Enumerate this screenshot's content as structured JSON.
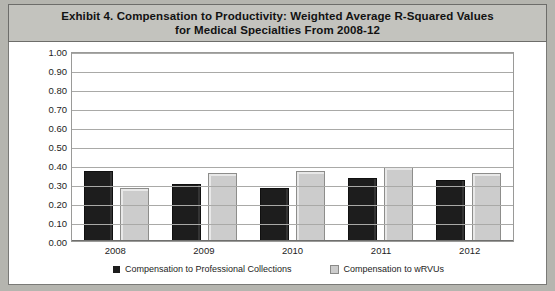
{
  "title": {
    "line1": "Exhibit 4. Compensation to Productivity: Weighted Average R-Squared Values",
    "line2": "for Medical Specialties From 2008-12"
  },
  "colors": {
    "series_dark": "#1d1d1d",
    "series_light": "#cccccc",
    "gridline": "#a9a9a7",
    "title_band": "#c3c3be",
    "page_background": "#b5b5af",
    "plot_background": "#ffffff"
  },
  "chart_data": {
    "type": "bar",
    "title": "Exhibit 4. Compensation to Productivity: Weighted Average R-Squared Values for Medical Specialties From 2008-12",
    "xlabel": "",
    "ylabel": "",
    "ylim": [
      0,
      1
    ],
    "ytick_step": 0.1,
    "ytick_labels": [
      "1.00",
      "0.90",
      "0.80",
      "0.70",
      "0.60",
      "0.50",
      "0.40",
      "0.30",
      "0.20",
      "0.10",
      "0.00"
    ],
    "grid": true,
    "legend_position": "bottom",
    "categories": [
      "2008",
      "2009",
      "2010",
      "2011",
      "2012"
    ],
    "series": [
      {
        "name": "Compensation to Professional Collections",
        "color": "#1d1d1d",
        "values": [
          0.37,
          0.3,
          0.28,
          0.33,
          0.32
        ]
      },
      {
        "name": "Compensation to wRVUs",
        "color": "#cccccc",
        "values": [
          0.28,
          0.36,
          0.37,
          0.39,
          0.36
        ]
      }
    ]
  }
}
